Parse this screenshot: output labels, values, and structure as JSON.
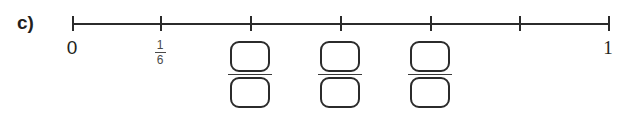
{
  "exercise": {
    "letter": "c)"
  },
  "numberline": {
    "line_color": "#2b2b2b",
    "axis": {
      "start_x": 72,
      "end_x": 608,
      "y": 23
    },
    "tick_count": 7,
    "ticks": [
      {
        "x": 72,
        "value": "0",
        "label": "0",
        "label_type": "integer"
      },
      {
        "x": 160,
        "value": "1/6",
        "label": "",
        "label_type": "fraction",
        "numerator": "1",
        "denominator": "6"
      },
      {
        "x": 250,
        "value": "2/6",
        "label": "",
        "label_type": "answer-box"
      },
      {
        "x": 340,
        "value": "3/6",
        "label": "",
        "label_type": "answer-box"
      },
      {
        "x": 430,
        "value": "4/6",
        "label": "",
        "label_type": "answer-box"
      },
      {
        "x": 519,
        "value": "5/6",
        "label": "",
        "label_type": "none"
      },
      {
        "x": 608,
        "value": "1",
        "label": "1",
        "label_type": "integer"
      }
    ]
  },
  "labels": {
    "zero": "0",
    "one": "1",
    "fraction_one_sixth": {
      "numerator": "1",
      "denominator": "6"
    }
  },
  "answer_fields": [
    {
      "x": 250,
      "numerator": "",
      "denominator": ""
    },
    {
      "x": 340,
      "numerator": "",
      "denominator": ""
    },
    {
      "x": 430,
      "numerator": "",
      "denominator": ""
    }
  ]
}
